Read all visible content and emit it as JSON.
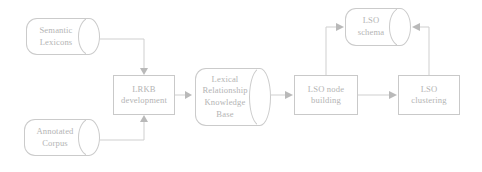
{
  "diagram": {
    "type": "flowchart",
    "stroke_color": "#c9c9c9",
    "text_color": "#b4b4b4",
    "background_color": "#ffffff",
    "nodes": [
      {
        "id": "semantic-lexicons",
        "shape": "cylinder",
        "label": "Semantic\nLexicons",
        "line1": "Semantic",
        "line2": "Lexicons",
        "x": 26,
        "y": 18,
        "w": 74,
        "h": 37
      },
      {
        "id": "annotated-corpus",
        "shape": "cylinder",
        "label": "Annotated\nCorpus",
        "line1": "Annotated",
        "line2": "Corpus",
        "x": 24,
        "y": 119,
        "w": 76,
        "h": 37
      },
      {
        "id": "lrkb-development",
        "shape": "rectangle",
        "label": "LRKB\ndevelopment",
        "line1": "LRKB",
        "line2": "development",
        "x": 113,
        "y": 75,
        "w": 62,
        "h": 40
      },
      {
        "id": "lexical-relationship-knowledge-base",
        "shape": "cylinder",
        "label": "Lexical\nRelationship\nKnowledge\nBase",
        "line1": "Lexical",
        "line2": "Relationship",
        "line3": "Knowledge",
        "line4": "Base",
        "x": 195,
        "y": 68,
        "w": 76,
        "h": 58
      },
      {
        "id": "lso-node-building",
        "shape": "rectangle",
        "label": "LSO node\nbuilding",
        "line1": "LSO node",
        "line2": "building",
        "x": 294,
        "y": 75,
        "w": 64,
        "h": 40
      },
      {
        "id": "lso-clustering",
        "shape": "rectangle",
        "label": "LSO\nclustering",
        "line1": "LSO",
        "line2": "clustering",
        "x": 398,
        "y": 75,
        "w": 62,
        "h": 40
      },
      {
        "id": "lso-schema",
        "shape": "cylinder",
        "label": "LSO\nschema",
        "line1": "LSO",
        "line2": "schema",
        "x": 345,
        "y": 8,
        "w": 66,
        "h": 38
      }
    ],
    "edges": [
      {
        "id": "semantic-lexicons-to-lrkb",
        "from": "semantic-lexicons",
        "to": "lrkb-development",
        "arrow": "down"
      },
      {
        "id": "annotated-corpus-to-lrkb",
        "from": "annotated-corpus",
        "to": "lrkb-development",
        "arrow": "up"
      },
      {
        "id": "lrkb-to-knowledge-base",
        "from": "lrkb-development",
        "to": "lexical-relationship-knowledge-base",
        "arrow": "right"
      },
      {
        "id": "knowledge-base-to-lso-node",
        "from": "lexical-relationship-knowledge-base",
        "to": "lso-node-building",
        "arrow": "right"
      },
      {
        "id": "lso-node-to-lso-clustering",
        "from": "lso-node-building",
        "to": "lso-clustering",
        "arrow": "right"
      },
      {
        "id": "lso-node-to-lso-schema",
        "from": "lso-node-building",
        "to": "lso-schema",
        "arrow": "right"
      },
      {
        "id": "lso-clustering-to-lso-schema",
        "from": "lso-clustering",
        "to": "lso-schema",
        "arrow": "left"
      }
    ]
  }
}
